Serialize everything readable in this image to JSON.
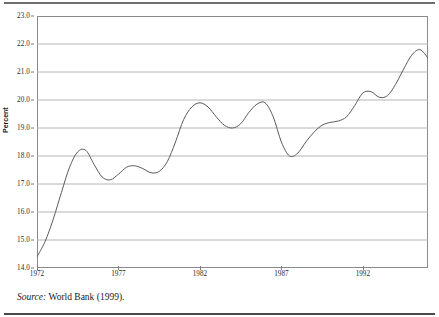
{
  "figure": {
    "axis_title": "Percent",
    "source_prefix": "Source:",
    "source_text": "World Bank (1999)."
  },
  "colors": {
    "line": "#5a5a5a",
    "grid": "#b4b4b4",
    "frame": "#8a8a8a",
    "text": "#1a1a1a",
    "rule": "#6e6e6e",
    "background": "#ffffff"
  },
  "chart_data": {
    "type": "line",
    "title": "",
    "subtitle": "",
    "xlabel": "",
    "ylabel": "Percent",
    "xlim": [
      1972,
      1996
    ],
    "ylim": [
      14.0,
      23.0
    ],
    "grid": true,
    "legend": "none",
    "y_ticks": [
      14.0,
      15.0,
      16.0,
      17.0,
      18.0,
      19.0,
      20.0,
      21.0,
      22.0,
      23.0
    ],
    "y_tick_labels": [
      "14.0",
      "15.0",
      "16.0",
      "17.0",
      "18.0",
      "19.0",
      "20.0",
      "21.0",
      "22.0",
      "23.0"
    ],
    "x_ticks": [
      1972,
      1977,
      1982,
      1987,
      1992
    ],
    "x_tick_labels": [
      "1972",
      "1977",
      "1982",
      "1987",
      "1992"
    ],
    "series": [
      {
        "name": "Percent",
        "x": [
          1972,
          1972.5,
          1973,
          1973.5,
          1974,
          1974.5,
          1975,
          1975.5,
          1976,
          1976.5,
          1977,
          1977.5,
          1978,
          1978.5,
          1979,
          1979.5,
          1980,
          1980.5,
          1981,
          1981.5,
          1982,
          1982.5,
          1983,
          1983.5,
          1984,
          1984.5,
          1985,
          1985.5,
          1986,
          1986.5,
          1987,
          1987.5,
          1988,
          1988.5,
          1989,
          1989.5,
          1990,
          1990.5,
          1991,
          1991.5,
          1992,
          1992.5,
          1993,
          1993.5,
          1994,
          1994.5,
          1995,
          1995.5,
          1996
        ],
        "values": [
          14.4,
          14.95,
          15.75,
          16.7,
          17.6,
          18.15,
          18.2,
          17.7,
          17.25,
          17.15,
          17.35,
          17.6,
          17.65,
          17.55,
          17.4,
          17.45,
          17.8,
          18.5,
          19.3,
          19.75,
          19.9,
          19.75,
          19.4,
          19.1,
          19.0,
          19.15,
          19.55,
          19.85,
          19.9,
          19.4,
          18.5,
          18.0,
          18.1,
          18.5,
          18.85,
          19.1,
          19.2,
          19.25,
          19.4,
          19.8,
          20.25,
          20.3,
          20.1,
          20.15,
          20.55,
          21.1,
          21.6,
          21.8,
          21.5
        ]
      }
    ]
  }
}
